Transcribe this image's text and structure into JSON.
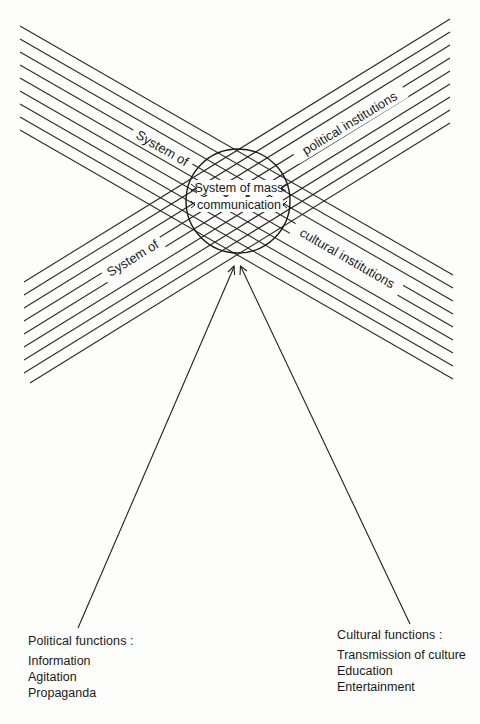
{
  "diagram": {
    "center": {
      "line1": "System of mass",
      "line2": "communication"
    },
    "bands": {
      "upper_left_label": "System of",
      "upper_right_label": "political institutions",
      "lower_left_label": "System of",
      "lower_right_label": "cultural institutions"
    },
    "political_functions": {
      "title": "Political functions :",
      "items": [
        "Information",
        "Agitation",
        "Propaganda"
      ]
    },
    "cultural_functions": {
      "title": "Cultural functions :",
      "items": [
        "Transmission of culture",
        "Education",
        "Entertainment"
      ]
    },
    "colors": {
      "ink": "#1a1a1a",
      "paper": "#fdfdfc"
    }
  }
}
